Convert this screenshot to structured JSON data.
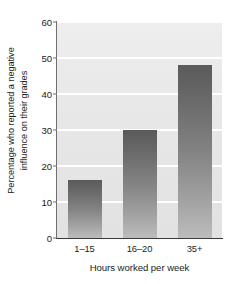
{
  "chart_data": {
    "type": "bar",
    "title": "",
    "categories": [
      "1–15",
      "16–20",
      "35+"
    ],
    "values": [
      16,
      30,
      48
    ],
    "series": [
      {
        "name": "Percentage who reported a negative influence on their grades",
        "values": [
          16,
          30,
          48
        ]
      }
    ],
    "xlabel": "Hours worked per week",
    "ylabel_lines": [
      "Percentage who reported a negative",
      "influence on their grades"
    ],
    "ylabel": "Percentage who reported a negative influence on their grades",
    "ylim": [
      0,
      60
    ],
    "yticks": [
      0,
      10,
      20,
      30,
      40,
      50,
      60
    ],
    "ytick_labels": [
      "0",
      "10",
      "20",
      "30",
      "40",
      "50",
      "60"
    ],
    "grid": "horizontal",
    "gridline_color": "#ffffff",
    "plot_background": "#e8e8e8",
    "bar_color_top": "#5a5a5a",
    "bar_color_bottom": "#bcbcbc",
    "axis_color": "#3a3a3a",
    "text_color": "#1b1b1b",
    "legend": null,
    "legend_position": "none"
  }
}
